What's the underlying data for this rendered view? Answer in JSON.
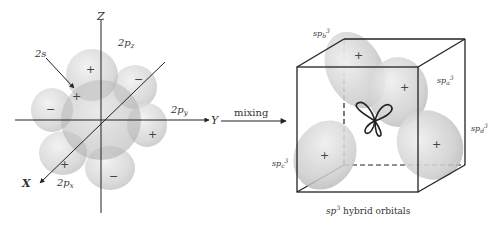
{
  "left_figure": {
    "title": "atomic orbitals before mixing",
    "axes": {
      "x": "X",
      "y": "Y",
      "z": "Z"
    },
    "labels": {
      "s": "2s",
      "pz": "2p",
      "pz_sub": "z",
      "py": "2p",
      "py_sub": "y",
      "px": "2p",
      "px_sub": "x"
    },
    "signs": {
      "pz_top": "+",
      "pz_bottom": "−",
      "py_left": "−",
      "py_right": "+",
      "px_front": "+",
      "px_back": "−",
      "s_center": "+"
    }
  },
  "arrow": {
    "label": "mixing"
  },
  "right_figure": {
    "labels": {
      "a": "sp",
      "a_sub": "a",
      "b": "sp",
      "b_sub": "b",
      "c": "sp",
      "c_sub": "c",
      "d": "sp",
      "d_sub": "d",
      "sup": "3"
    },
    "signs": {
      "a": "+",
      "b": "+",
      "c": "+",
      "d": "+"
    },
    "caption_prefix": "sp",
    "caption_sup": "3",
    "caption_suffix": " hybrid orbitals"
  },
  "colors": {
    "lobe_fill": "#c8c8c8",
    "lobe_edge": "#b0b0b0",
    "line": "#222222",
    "background": "#ffffff"
  }
}
